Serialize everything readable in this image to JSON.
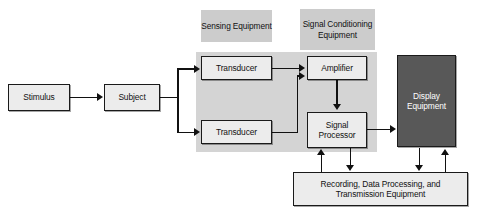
{
  "diagram": {
    "colors": {
      "band": "#d4d4d4",
      "group_label_bg": "#cccccc",
      "box_fill": "#ececec",
      "box_dark_fill": "#585858",
      "line": "#111111",
      "page_bg": "#ffffff"
    },
    "group_labels": [
      {
        "id": "sensing",
        "text": "Sensing Equipment"
      },
      {
        "id": "signal-conditioning",
        "text": "Signal Conditioning Equipment"
      }
    ],
    "blocks": [
      {
        "id": "stimulus",
        "label": "Stimulus",
        "style": "light"
      },
      {
        "id": "subject",
        "label": "Subject",
        "style": "light"
      },
      {
        "id": "transducer-top",
        "label": "Transducer",
        "style": "light"
      },
      {
        "id": "transducer-bottom",
        "label": "Transducer",
        "style": "light"
      },
      {
        "id": "amplifier",
        "label": "Amplifier",
        "style": "light"
      },
      {
        "id": "signal-processor",
        "label": "Signal Processor",
        "style": "light"
      },
      {
        "id": "display-equipment",
        "label": "Display Equipment",
        "style": "dark"
      },
      {
        "id": "recording",
        "label": "Recording, Data Processing, and Transmission Equipment",
        "style": "light"
      }
    ],
    "connections": [
      {
        "from": "stimulus",
        "to": "subject"
      },
      {
        "from": "subject",
        "to": "transducer-top"
      },
      {
        "from": "subject",
        "to": "transducer-bottom"
      },
      {
        "from": "transducer-top",
        "to": "amplifier"
      },
      {
        "from": "transducer-bottom",
        "to": "amplifier"
      },
      {
        "from": "amplifier",
        "to": "signal-processor"
      },
      {
        "from": "signal-processor",
        "to": "display-equipment"
      },
      {
        "from": "recording",
        "to": "signal-processor"
      },
      {
        "from": "signal-processor",
        "to": "recording"
      },
      {
        "from": "display-equipment",
        "to": "recording"
      },
      {
        "from": "recording",
        "to": "display-equipment"
      }
    ]
  }
}
